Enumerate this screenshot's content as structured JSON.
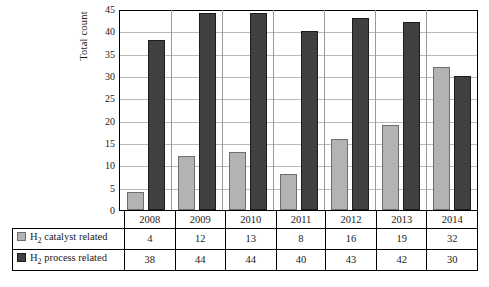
{
  "chart_data": {
    "type": "bar",
    "title": "",
    "xlabel": "",
    "ylabel": "Total count",
    "ylim": [
      0,
      45
    ],
    "yticks": [
      0,
      5,
      10,
      15,
      20,
      25,
      30,
      35,
      40,
      45
    ],
    "grid": true,
    "legend_position": "table-row-headers",
    "categories": [
      "2008",
      "2009",
      "2010",
      "2011",
      "2012",
      "2013",
      "2014"
    ],
    "series": [
      {
        "name": "H2 catalyst related",
        "name_parts": {
          "pre": "H",
          "sub": "2",
          "post": " catalyst related"
        },
        "color": "#b3b3b3",
        "values": [
          4,
          12,
          13,
          8,
          16,
          19,
          32
        ]
      },
      {
        "name": "H2 process related",
        "name_parts": {
          "pre": "H",
          "sub": "2",
          "post": " process related"
        },
        "color": "#404040",
        "values": [
          38,
          44,
          44,
          40,
          43,
          42,
          30
        ]
      }
    ]
  }
}
